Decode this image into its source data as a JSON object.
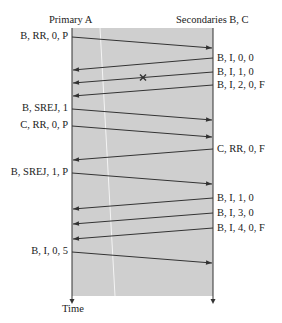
{
  "header": {
    "primary": "Primary A",
    "secondaries": "Secondaries B, C"
  },
  "axis": {
    "time": "Time"
  },
  "colors": {
    "panel": "#cfcfcf",
    "line": "#333333",
    "highlight": "#f4f4f4"
  },
  "messages": [
    {
      "label": "B, RR, 0, P",
      "dir": "right",
      "y1": 37,
      "y2": 48
    },
    {
      "label": "B, I, 0, 0",
      "dir": "left",
      "y1": 58,
      "y2": 70
    },
    {
      "label": "B, I, 1, 0",
      "dir": "left",
      "y1": 72,
      "y2": 83,
      "lost": true
    },
    {
      "label": "B, I, 2, 0, F",
      "dir": "left",
      "y1": 85,
      "y2": 96
    },
    {
      "label": "B, SREJ, 1",
      "dir": "right",
      "y1": 109,
      "y2": 120
    },
    {
      "label": "C, RR, 0, P",
      "dir": "right",
      "y1": 126,
      "y2": 137
    },
    {
      "label": "C, RR, 0, F",
      "dir": "left",
      "y1": 149,
      "y2": 160
    },
    {
      "label": "B, SREJ, 1, P",
      "dir": "right",
      "y1": 173,
      "y2": 184
    },
    {
      "label": "B, I, 1, 0",
      "dir": "left",
      "y1": 198,
      "y2": 209
    },
    {
      "label": "B, I, 3, 0",
      "dir": "left",
      "y1": 213,
      "y2": 224
    },
    {
      "label": "B, I, 4, 0, F",
      "dir": "left",
      "y1": 228,
      "y2": 239
    },
    {
      "label": "B, I, 0, 5",
      "dir": "right",
      "y1": 252,
      "y2": 263
    }
  ]
}
